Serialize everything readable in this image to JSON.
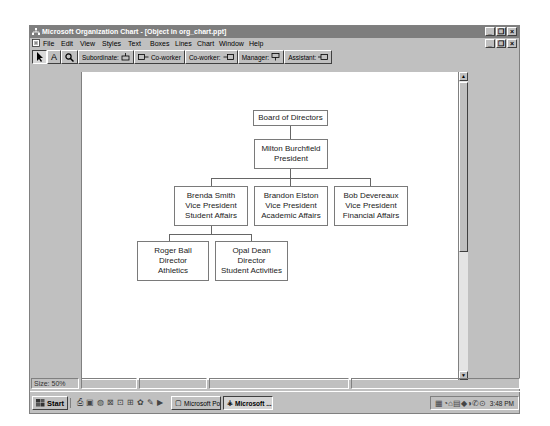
{
  "window": {
    "title": "Microsoft Organization Chart - [Object in org_chart.ppt]",
    "controls": {
      "minimize": "_",
      "restore": "❐",
      "close": "×"
    }
  },
  "menu": [
    "File",
    "Edit",
    "View",
    "Styles",
    "Text",
    "Boxes",
    "Lines",
    "Chart",
    "Window",
    "Help"
  ],
  "toolbar": {
    "select_icon": "pointer",
    "text_icon": "A",
    "zoom_icon": "magnifier",
    "subordinate": "Subordinate:",
    "coworker_left": "Co-worker",
    "coworker_right": "Co-worker:",
    "manager": "Manager:",
    "assistant": "Assistant:"
  },
  "org_chart": {
    "root": {
      "lines": [
        "Board of Directors"
      ]
    },
    "president": {
      "lines": [
        "Milton Burchfield",
        "President"
      ]
    },
    "vps": [
      {
        "lines": [
          "Brenda Smith",
          "Vice President",
          "Student Affairs"
        ]
      },
      {
        "lines": [
          "Brandon Elston",
          "Vice President",
          "Academic Affairs"
        ]
      },
      {
        "lines": [
          "Bob Devereaux",
          "Vice President",
          "Financial Affairs"
        ]
      }
    ],
    "directors": [
      {
        "lines": [
          "Roger Ball",
          "Director",
          "Athletics"
        ]
      },
      {
        "lines": [
          "Opal Dean",
          "Director",
          "Student Activities"
        ]
      }
    ]
  },
  "status": {
    "size": "Size: 50%"
  },
  "taskbar": {
    "start": "Start",
    "tasks": [
      {
        "label": "Microsoft Pow...",
        "active": false
      },
      {
        "label": "Microsoft ...",
        "active": true
      }
    ],
    "clock": "3:48 PM"
  }
}
